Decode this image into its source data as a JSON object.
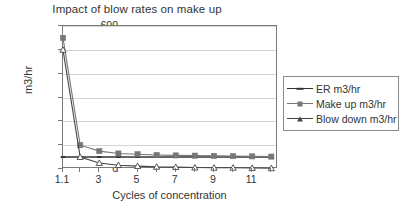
{
  "chart_data": {
    "type": "line",
    "title": "Impact of blow rates on make up",
    "xlabel": "Cycles of concentration",
    "ylabel": "m3/hr",
    "x": [
      1.1,
      2,
      3,
      4,
      5,
      6,
      7,
      8,
      9,
      10,
      11,
      12
    ],
    "x_tick_labels": [
      "1.1",
      "3",
      "5",
      "7",
      "9",
      "11"
    ],
    "x_tick_values": [
      1.1,
      3,
      5,
      7,
      9,
      11
    ],
    "y_tick_labels": [
      "0",
      "100",
      "200",
      "300",
      "400",
      "500",
      "600"
    ],
    "y_tick_values": [
      0,
      100,
      200,
      300,
      400,
      500,
      600
    ],
    "ylim": [
      0,
      600
    ],
    "grid": "horizontal",
    "legend_position": "right",
    "series": [
      {
        "name": "ER m3/hr",
        "marker": "dash",
        "color": "#333333",
        "values": [
          50,
          50,
          50,
          50,
          50,
          50,
          50,
          50,
          50,
          50,
          50,
          50
        ]
      },
      {
        "name": "Make up m3/hr",
        "marker": "square",
        "color": "#777777",
        "values": [
          550,
          100,
          75,
          65,
          62,
          59,
          57,
          56,
          55,
          54,
          53,
          52
        ]
      },
      {
        "name": "Blow down m3/hr",
        "marker": "triangle",
        "color": "#444444",
        "values": [
          500,
          50,
          25,
          16,
          12,
          9,
          8,
          6,
          5,
          5,
          4,
          3
        ]
      }
    ]
  }
}
